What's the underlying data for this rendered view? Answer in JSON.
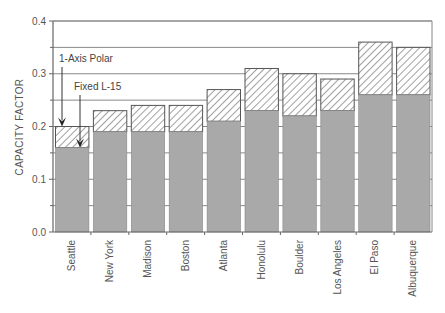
{
  "chart_data": {
    "type": "bar",
    "stacked": true,
    "title": "",
    "xlabel": "",
    "ylabel": "CAPACITY FACTOR",
    "ylim": [
      0.0,
      0.4
    ],
    "yticks": [
      "0.0",
      "0.1",
      "0.2",
      "0.3",
      "0.4"
    ],
    "grid": true,
    "categories": [
      "Seattle",
      "New York",
      "Madison",
      "Boston",
      "Atlanta",
      "Honolulu",
      "Boulder",
      "Los Angeles",
      "El Paso",
      "Albuquerque"
    ],
    "series": [
      {
        "name": "Fixed L-15",
        "values": [
          0.16,
          0.19,
          0.19,
          0.19,
          0.21,
          0.23,
          0.22,
          0.23,
          0.26,
          0.26
        ],
        "color": "#a9a9a9",
        "pattern": "solid"
      },
      {
        "name": "1-Axis Polar",
        "totals": [
          0.2,
          0.23,
          0.24,
          0.24,
          0.27,
          0.31,
          0.3,
          0.29,
          0.36,
          0.35
        ],
        "color": "#ffffff",
        "pattern": "hatched"
      }
    ],
    "annotations": [
      {
        "text": "1-Axis Polar",
        "points_to": "Seattle total (top of hatched bar)"
      },
      {
        "text": "Fixed L-15",
        "points_to": "Seattle gray bar top"
      }
    ]
  },
  "colors": {
    "fixed": "#a9a9a9",
    "hatch": "#555555",
    "axis": "#666666",
    "grid": "#888888"
  }
}
